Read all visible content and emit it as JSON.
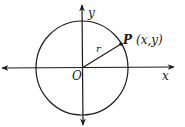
{
  "diagram": {
    "type": "unit-circle-coordinate",
    "labels": {
      "y_axis": "y",
      "x_axis": "x",
      "origin": "O",
      "radius": "r",
      "point_name": "P",
      "point_coords": "(x,y)"
    },
    "colors": {
      "stroke": "#1a1a1a",
      "background": "#ffffff"
    }
  }
}
